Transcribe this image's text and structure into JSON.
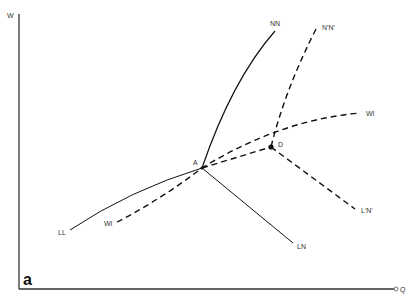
{
  "figure": {
    "panel_label": "a",
    "axes": {
      "y_label": "W",
      "x_label": "Q"
    },
    "points": {
      "A": "A",
      "D": "D"
    },
    "curves": {
      "NN": "NN",
      "N_prime_N_prime": "N'N'",
      "WI_upper": "WI",
      "WI_lower": "WI",
      "LL": "LL",
      "LN": "LN",
      "L_prime_N_prime": "L'N'"
    },
    "colors": {
      "line": "#111111",
      "label": "#333333"
    }
  }
}
